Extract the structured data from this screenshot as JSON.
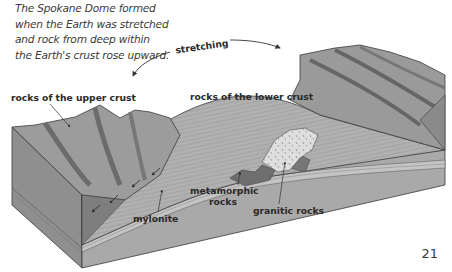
{
  "caption": {
    "lines": [
      "The Spokane Dome formed",
      "when the Earth was stretched",
      "and rock from deep within",
      "the Earth's crust rose upward."
    ]
  },
  "diagram": {
    "arrow_label": "stretching",
    "labels": {
      "upper_crust": "rocks of the upper crust",
      "lower_crust": "rocks of the lower crust",
      "mylonite": "mylonite",
      "metamorphic_1": "metamorphic",
      "metamorphic_2": "rocks",
      "granitic": "granitic rocks"
    },
    "colors": {
      "front_face": "#8f8f8f",
      "side_face": "#a9a9a9",
      "top_upper": "#9a9a9a",
      "dark_band": "#6c6c6c",
      "lower_crust": "#b3b3b3",
      "granite": "#dcdcdc",
      "outline": "#3a3a3a"
    }
  },
  "page_number": "21"
}
